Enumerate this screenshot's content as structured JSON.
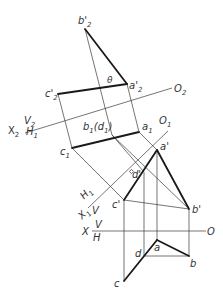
{
  "diagram": {
    "type": "descriptive-geometry-auxiliary-projection",
    "labels": {
      "b2p": "b'",
      "b2p_sub": "2",
      "a2p": "a'",
      "a2p_sub": "2",
      "c2p": "c'",
      "c2p_sub": "2",
      "theta": "θ",
      "O2": "O",
      "O2_sub": "2",
      "V2": "V",
      "V2_sub": "2",
      "X2": "X",
      "X2_sub": "2",
      "H1_a": "H",
      "H1_a_sub": "1",
      "b1d1": "b",
      "b1d1_sub": "1",
      "b1d1_paren": "(d",
      "b1d1_paren_sub": "1",
      "b1d1_close": ")",
      "a1": "a",
      "a1_sub": "1",
      "O1": "O",
      "O1_sub": "1",
      "c1": "c",
      "c1_sub": "1",
      "ap": "a'",
      "dp": "d'",
      "cp": "c'",
      "bp": "b'",
      "H1_b": "H",
      "H1_b_sub": "1",
      "X1": "X",
      "X1_sub": "1",
      "V1": "V",
      "X": "X",
      "V": "V",
      "H": "H",
      "O": "O",
      "a": "a",
      "b": "b",
      "c": "c",
      "d": "d"
    },
    "colors": {
      "line": "#3a3a3a",
      "thick": "#1a1a1a",
      "background": "#ffffff"
    }
  }
}
